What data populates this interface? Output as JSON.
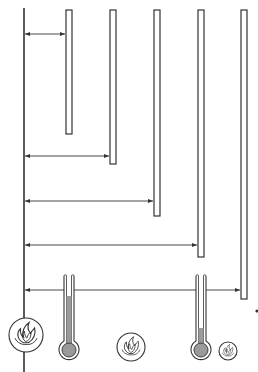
{
  "diagram": {
    "colors": {
      "stroke": "#333333",
      "fill_mercury": "#9a9a9a",
      "background": "#ffffff"
    },
    "source_line": {
      "x": 24,
      "y1": 8,
      "y2": 372
    },
    "rods": [
      {
        "x": 66,
        "y_top": 10,
        "y_bottom": 134,
        "arrow_y": 34
      },
      {
        "x": 110,
        "y_top": 10,
        "y_bottom": 164,
        "arrow_y": 156
      },
      {
        "x": 154,
        "y_top": 10,
        "y_bottom": 216,
        "arrow_y": 201
      },
      {
        "x": 198,
        "y_top": 10,
        "y_bottom": 257,
        "arrow_y": 245
      },
      {
        "x": 241,
        "y_top": 10,
        "y_bottom": 299,
        "arrow_y": 290
      }
    ],
    "thermometers": [
      {
        "cx": 69,
        "top": 276,
        "bulb_cy": 350,
        "level_y": 296
      },
      {
        "cx": 201,
        "top": 276,
        "bulb_cy": 350,
        "level_y": 328
      }
    ],
    "flames": [
      {
        "cx": 26,
        "cy": 335,
        "r": 17
      },
      {
        "cx": 131,
        "cy": 347,
        "r": 14
      },
      {
        "cx": 228,
        "cy": 351,
        "r": 9
      }
    ],
    "dot": {
      "cx": 257,
      "cy": 311
    }
  }
}
